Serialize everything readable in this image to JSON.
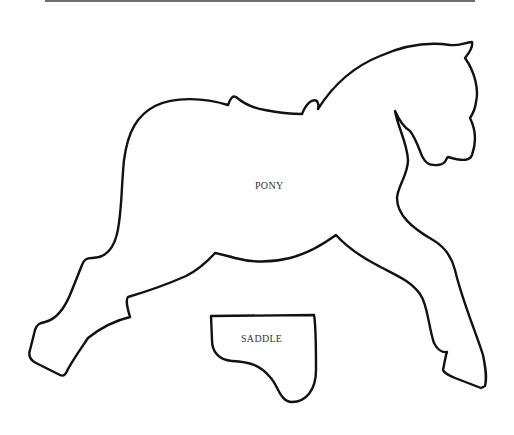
{
  "page": {
    "kind": "cut-out pattern template"
  },
  "pieces": [
    {
      "id": "pony",
      "label": "PONY"
    },
    {
      "id": "saddle",
      "label": "SADDLE"
    }
  ],
  "colors": {
    "outline": "#111111",
    "label": "#333333",
    "rule": "#6e6e6e",
    "background": "#ffffff"
  }
}
